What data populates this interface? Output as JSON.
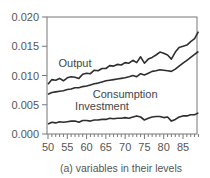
{
  "chart_data": {
    "type": "line",
    "title": "",
    "caption": "(a) variables in their levels",
    "xlabel": "",
    "ylabel": "",
    "xlim": [
      49.8,
      89.5
    ],
    "ylim": [
      0.0,
      0.02
    ],
    "grid": false,
    "legend": "inline labels",
    "x_ticks": [
      50,
      55,
      60,
      65,
      70,
      75,
      80,
      85
    ],
    "x_tick_labels": [
      "50",
      "55",
      "60",
      "65",
      "70",
      "75",
      "80",
      "85"
    ],
    "y_ticks": [
      0.0,
      0.005,
      0.01,
      0.015,
      0.02
    ],
    "y_tick_labels": [
      "0.000",
      "0.005",
      "0.010",
      "0.015",
      "0.020"
    ],
    "x": [
      50,
      51,
      52,
      53,
      54,
      55,
      56,
      57,
      58,
      59,
      60,
      61,
      62,
      63,
      64,
      65,
      66,
      67,
      68,
      69,
      70,
      71,
      72,
      73,
      74,
      75,
      76,
      77,
      78,
      79,
      80,
      81,
      82,
      83,
      84,
      85,
      86,
      87,
      88,
      89
    ],
    "series": [
      {
        "name": "Output",
        "label_pos": [
          57,
          0.0115
        ],
        "values": [
          0.0085,
          0.0093,
          0.0092,
          0.0095,
          0.0091,
          0.0096,
          0.0098,
          0.0097,
          0.0095,
          0.0102,
          0.0104,
          0.0103,
          0.0109,
          0.0108,
          0.0112,
          0.0112,
          0.0117,
          0.0116,
          0.0119,
          0.0118,
          0.0122,
          0.0121,
          0.0126,
          0.0122,
          0.0132,
          0.0121,
          0.0128,
          0.0131,
          0.0135,
          0.014,
          0.0138,
          0.0135,
          0.0128,
          0.014,
          0.0148,
          0.015,
          0.0152,
          0.0158,
          0.0163,
          0.0175
        ]
      },
      {
        "name": "Consumption",
        "label_pos": [
          70,
          0.0062
        ],
        "values": [
          0.0068,
          0.0071,
          0.0072,
          0.0073,
          0.0074,
          0.0076,
          0.0077,
          0.0079,
          0.0079,
          0.0081,
          0.0082,
          0.0084,
          0.0086,
          0.0087,
          0.0089,
          0.0091,
          0.0092,
          0.0093,
          0.0094,
          0.0095,
          0.0096,
          0.0098,
          0.01,
          0.0098,
          0.0103,
          0.0101,
          0.0104,
          0.0107,
          0.0108,
          0.011,
          0.0109,
          0.0108,
          0.0107,
          0.0111,
          0.0116,
          0.0121,
          0.0126,
          0.0131,
          0.0136,
          0.0141
        ]
      },
      {
        "name": "Investment",
        "label_pos": [
          64,
          0.0041
        ],
        "values": [
          0.0017,
          0.002,
          0.0019,
          0.0021,
          0.002,
          0.0021,
          0.0022,
          0.0022,
          0.002,
          0.0023,
          0.0023,
          0.0022,
          0.0024,
          0.0024,
          0.0025,
          0.0025,
          0.0027,
          0.0026,
          0.0027,
          0.0027,
          0.0028,
          0.0027,
          0.0029,
          0.0031,
          0.0029,
          0.0024,
          0.0027,
          0.0029,
          0.003,
          0.003,
          0.0028,
          0.0029,
          0.0022,
          0.0025,
          0.0029,
          0.0031,
          0.0031,
          0.0033,
          0.0033,
          0.0036
        ]
      }
    ]
  },
  "frame": {
    "left": 47,
    "top": 17,
    "right": 197,
    "bottom": 134
  },
  "colors": {
    "axis": "#777777",
    "line": "#2e2e2e",
    "text": "#555555"
  }
}
